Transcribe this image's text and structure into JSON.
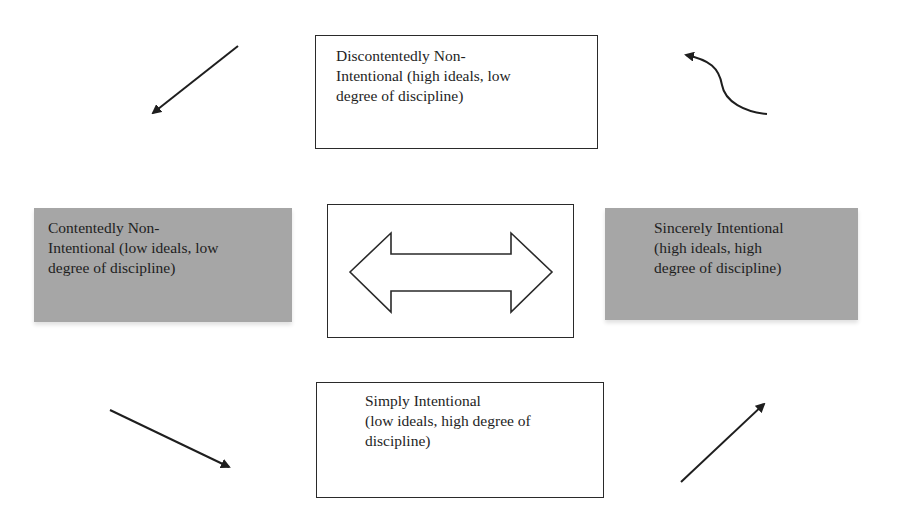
{
  "diagram": {
    "top_box": {
      "lines": [
        "Discontentedly Non-",
        "Intentional (high ideals, low",
        "degree of discipline)"
      ]
    },
    "left_box": {
      "lines": [
        "Contentedly Non-",
        "Intentional (low ideals, low",
        "degree of discipline)"
      ],
      "fill": "#a6a6a6"
    },
    "right_box": {
      "lines": [
        "Sincerely Intentional",
        "(high ideals, high",
        "degree of discipline)"
      ],
      "fill": "#a6a6a6"
    },
    "bottom_box": {
      "lines": [
        "Simply Intentional",
        "(low ideals, high degree of",
        "discipline)"
      ]
    },
    "center_box": {
      "icon": "double-headed-arrow-icon"
    },
    "arrows": [
      {
        "name": "arrow-top-left",
        "direction": "down-left",
        "shape": "straight"
      },
      {
        "name": "arrow-top-right",
        "direction": "up-left",
        "shape": "curved"
      },
      {
        "name": "arrow-bottom-left",
        "direction": "down-right",
        "shape": "straight"
      },
      {
        "name": "arrow-bottom-right",
        "direction": "up-right",
        "shape": "straight"
      }
    ],
    "colors": {
      "stroke": "#2a2a2a",
      "shaded_fill": "#a6a6a6",
      "background": "#ffffff"
    }
  }
}
